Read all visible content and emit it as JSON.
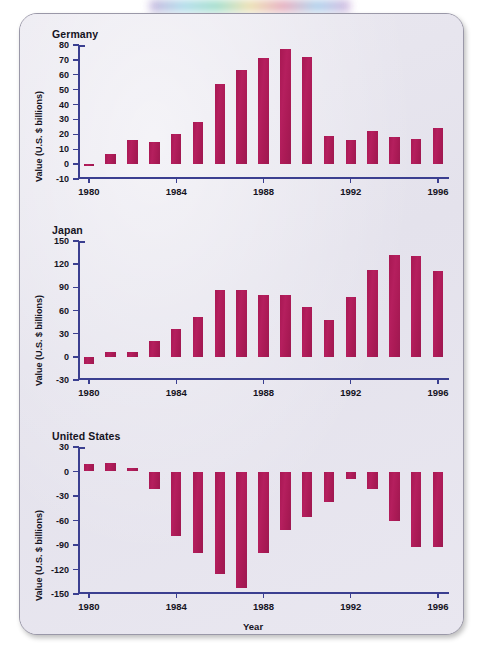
{
  "figure": {
    "xlabel": "Year",
    "ylabel": "Value (U.S. $ billions)",
    "bar_color": "#a81a55",
    "axis_color": "#3b3f90",
    "panel_background": "#e7e5ee"
  },
  "chart_data": [
    {
      "type": "bar",
      "title": "Germany",
      "xlabel": "Year",
      "ylabel": "Value (U.S. $ billions)",
      "ylim": [
        -10,
        80
      ],
      "yticks": [
        -10,
        0,
        10,
        20,
        30,
        40,
        50,
        60,
        70,
        80
      ],
      "ytick_labels": [
        "-10",
        "0",
        "10",
        "20",
        "30",
        "40",
        "50",
        "60",
        "70",
        "80"
      ],
      "xticks": [
        1980,
        1984,
        1988,
        1992,
        1996
      ],
      "xtick_labels": [
        "1980",
        "1984",
        "1988",
        "1992",
        "1996"
      ],
      "grid": false,
      "legend": "none",
      "categories": [
        1980,
        1981,
        1982,
        1983,
        1984,
        1985,
        1986,
        1987,
        1988,
        1989,
        1990,
        1991,
        1992,
        1993,
        1994,
        1995,
        1996
      ],
      "values": [
        -1,
        7,
        16,
        15,
        20,
        28,
        54,
        63,
        71,
        77,
        72,
        19,
        16,
        22,
        18,
        17,
        24
      ]
    },
    {
      "type": "bar",
      "title": "Japan",
      "xlabel": "Year",
      "ylabel": "Value (U.S. $ billions)",
      "ylim": [
        -30,
        150
      ],
      "yticks": [
        -30,
        0,
        30,
        60,
        90,
        120,
        150
      ],
      "ytick_labels": [
        "-30",
        "0",
        "30",
        "60",
        "90",
        "120",
        "150"
      ],
      "xticks": [
        1980,
        1984,
        1988,
        1992,
        1996
      ],
      "xtick_labels": [
        "1980",
        "1984",
        "1988",
        "1992",
        "1996"
      ],
      "grid": false,
      "legend": "none",
      "categories": [
        1980,
        1981,
        1982,
        1983,
        1984,
        1985,
        1986,
        1987,
        1988,
        1989,
        1990,
        1991,
        1992,
        1993,
        1994,
        1995,
        1996
      ],
      "values": [
        -9,
        6,
        6,
        20,
        36,
        51,
        86,
        86,
        80,
        80,
        64,
        48,
        78,
        113,
        132,
        131,
        111,
        74
      ]
    },
    {
      "type": "bar",
      "title": "United States",
      "xlabel": "Year",
      "ylabel": "Value (U.S. $ billions)",
      "ylim": [
        -150,
        30
      ],
      "yticks": [
        -150,
        -120,
        -90,
        -60,
        -30,
        0,
        30
      ],
      "ytick_labels": [
        "-150",
        "-120",
        "-90",
        "-60",
        "-30",
        "0",
        "30"
      ],
      "xticks": [
        1980,
        1984,
        1988,
        1992,
        1996
      ],
      "xtick_labels": [
        "1980",
        "1984",
        "1988",
        "1992",
        "1996"
      ],
      "grid": false,
      "legend": "none",
      "categories": [
        1980,
        1981,
        1982,
        1983,
        1984,
        1985,
        1986,
        1987,
        1988,
        1989,
        1990,
        1991,
        1992,
        1993,
        1994,
        1995,
        1996
      ],
      "values": [
        9,
        11,
        4,
        -22,
        -79,
        -100,
        -126,
        -143,
        -100,
        -72,
        -56,
        -37,
        -9,
        -22,
        -60,
        -92,
        -92,
        -105
      ]
    }
  ]
}
